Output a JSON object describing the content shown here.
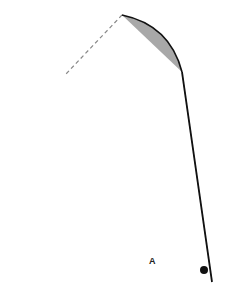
{
  "diagram": {
    "type": "fishing-rod-bend",
    "label": "A",
    "colors": {
      "rod": "#111111",
      "fill": "#a8a8a8",
      "dashed": "#888888",
      "reel": "#111111"
    }
  }
}
